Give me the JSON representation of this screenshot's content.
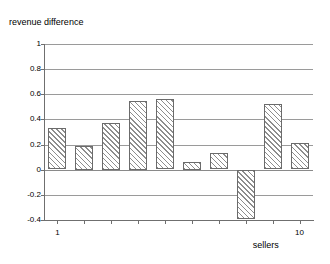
{
  "chart_data": {
    "type": "bar",
    "title": "revenue difference",
    "xlabel": "sellers",
    "ylabel": "",
    "categories": [
      "1",
      "2",
      "3",
      "4",
      "5",
      "6",
      "7",
      "8",
      "9",
      "10"
    ],
    "values": [
      0.33,
      0.19,
      0.37,
      0.55,
      0.56,
      0.06,
      0.13,
      -0.39,
      0.52,
      0.21
    ],
    "ylim": [
      -0.4,
      1
    ],
    "y_ticks": [
      "1",
      "0.8",
      "0.6",
      "0.4",
      "0.2",
      "0",
      "-0.2",
      "-0.4"
    ],
    "y_tick_values": [
      1,
      0.8,
      0.6,
      0.4,
      0.2,
      0,
      -0.2,
      -0.4
    ],
    "x_tick_labels": [
      "1",
      "10"
    ],
    "x_tick_label_indices": [
      0,
      9
    ],
    "grid": true,
    "legend": "none",
    "bar_fill": "diagonal-hatch",
    "colors": {
      "bar_outline": "#6b6b6b",
      "bar_hatch": "#8d8d8d",
      "gridline": "#9a9a9a",
      "axis": "#6f6f6f",
      "text": "#000000",
      "background": "#ffffff"
    }
  }
}
